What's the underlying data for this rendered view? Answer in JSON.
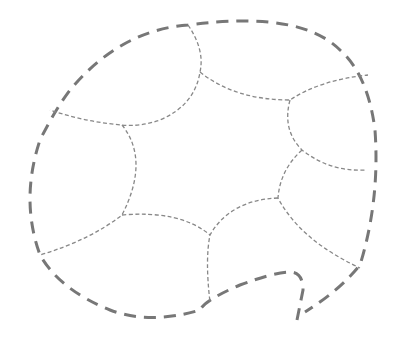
{
  "diagram": {
    "type": "dashed-region-map",
    "colors": {
      "outer_stroke": "#777777",
      "inner_stroke": "#888888",
      "background": "#ffffff"
    },
    "outer_boundary": "M 297 320 L 300 305 L 303 290 Q 303 272 290 272 Q 275 272 240 285 Q 205 300 200 310 Q 150 325 110 310 Q 60 290 40 255 Q 20 200 40 140 Q 55 110 70 90 Q 120 30 188 25 Q 300 10 340 50 Q 368 75 375 130 Q 380 200 360 265 Q 340 290 305 312",
    "inner_paths": [
      "M 188 25 Q 205 50 200 72 Q 195 105 160 120 Q 140 127 122 125 Q 85 122 50 110",
      "M 200 72 Q 235 100 290 100 Q 320 80 368 75",
      "M 290 100 Q 282 130 302 150 Q 330 172 365 170",
      "M 302 150 Q 280 170 278 198 Q 300 240 360 268",
      "M 278 198 Q 230 200 210 235 Q 205 260 210 302",
      "M 122 125 Q 150 160 122 215 Q 90 240 40 255",
      "M 122 215 Q 180 210 210 235"
    ]
  }
}
